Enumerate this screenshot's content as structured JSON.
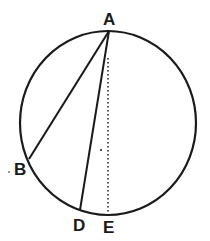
{
  "diagram": {
    "type": "circle-geometry",
    "colors": {
      "stroke": "#1a1a1a",
      "background": "#ffffff"
    },
    "circle": {
      "cx": 108,
      "cy": 123,
      "rx": 88,
      "ry": 92
    },
    "points": {
      "A": {
        "label": "A",
        "x": 109,
        "y": 31
      },
      "B": {
        "label": "B",
        "x": 29,
        "y": 159
      },
      "D": {
        "label": "D",
        "x": 80,
        "y": 210
      },
      "E": {
        "label": "E",
        "x": 109,
        "y": 215
      }
    },
    "segments": [
      {
        "from": "A",
        "to": "B",
        "style": "solid"
      },
      {
        "from": "A",
        "to": "D",
        "style": "solid"
      },
      {
        "from": "A",
        "to": "E",
        "style": "dotted"
      }
    ]
  }
}
